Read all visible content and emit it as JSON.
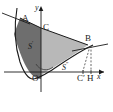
{
  "figure": {
    "background_color": "#ffffff",
    "stroke_color": "#1a1a1a",
    "region_dark_fill": "#6e6e6e",
    "region_light_fill": "#b8b8b8"
  },
  "axes": {
    "x_label": "x",
    "y_label": "y",
    "origin_label": "O"
  },
  "points": [
    {
      "id": "A",
      "label": "A",
      "x": 20,
      "y": 18
    },
    {
      "id": "C",
      "label": "C",
      "x": 41,
      "y": 28
    },
    {
      "id": "B",
      "label": "B",
      "x": 88,
      "y": 45
    },
    {
      "id": "O",
      "label": "O",
      "x": 31,
      "y": 74
    },
    {
      "id": "Cp",
      "label": "C",
      "prime": "′",
      "x": 83,
      "y": 74
    },
    {
      "id": "H",
      "label": "H",
      "x": 93,
      "y": 74
    }
  ],
  "regions": [
    {
      "id": "S-prime",
      "label": "S",
      "superscript": "′",
      "shade": "dark",
      "x": 28,
      "y": 42
    },
    {
      "id": "S-dprime",
      "label": "S",
      "superscript": "″",
      "shade": "light",
      "x": 62,
      "y": 63
    }
  ],
  "annotations": {
    "tangent_at_A": true,
    "tangent_at_B": true,
    "dashed_drop_lines": [
      "B-to-Cprime",
      "B-to-H"
    ],
    "angle_arc_at_vertex": true
  }
}
